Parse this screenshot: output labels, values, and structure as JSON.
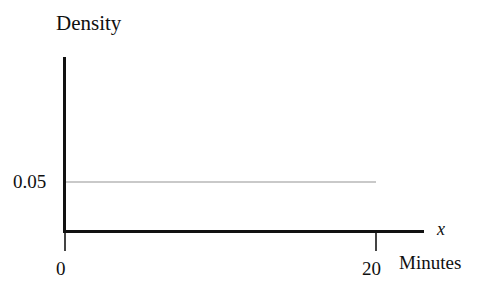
{
  "chart_data": {
    "type": "line",
    "title": "",
    "subtitle": "",
    "ylabel": "Density",
    "xlabel": "Minutes",
    "x_variable": "x",
    "grid": false,
    "legend": null,
    "xlim": [
      0,
      24
    ],
    "ylim": [
      0,
      0.11
    ],
    "x_ticks": [
      {
        "value": 0,
        "label": "0"
      },
      {
        "value": 20,
        "label": "20"
      }
    ],
    "y_ticks": [
      {
        "value": 0.05,
        "label": "0.05"
      }
    ],
    "series": [
      {
        "name": "uniform density",
        "color": "#c9c9c9",
        "x": [
          0,
          20
        ],
        "values": [
          0.05,
          0.05
        ]
      }
    ],
    "annotations": []
  },
  "axes": {
    "y_title": "Density",
    "x_title": "Minutes",
    "x_symbol": "x",
    "y_tick_0": "0.05",
    "x_tick_0": "0",
    "x_tick_1": "20"
  },
  "colors": {
    "axis": "#111111",
    "tick": "#444444",
    "density_line": "#c9c9c9",
    "background": "#ffffff",
    "text": "#101010"
  }
}
